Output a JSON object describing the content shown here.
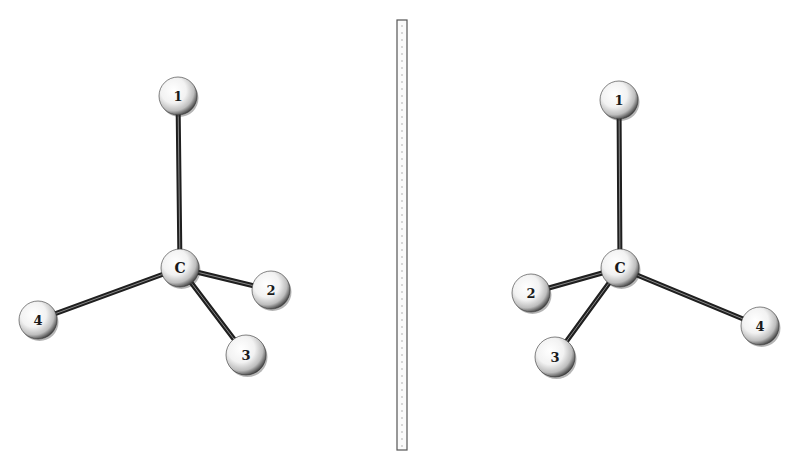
{
  "figure": {
    "colors": {
      "background": "#ffffff",
      "bond": "#1f1f1f",
      "atom_highlight": "#ffffff",
      "atom_shadow": "#2a2a2a",
      "mirror_edge": "#555555",
      "mirror_dots": "#9a9a9a"
    }
  },
  "left_molecule": {
    "center": {
      "label": "C",
      "x": 180,
      "y": 268,
      "r": 19
    },
    "substituents": [
      {
        "label": "1",
        "x": 178,
        "y": 96,
        "r": 19
      },
      {
        "label": "2",
        "x": 271,
        "y": 290,
        "r": 19
      },
      {
        "label": "3",
        "x": 246,
        "y": 355,
        "r": 20
      },
      {
        "label": "4",
        "x": 38,
        "y": 320,
        "r": 19
      }
    ]
  },
  "mirror": {
    "x": 397,
    "y": 20,
    "width": 10,
    "height": 430
  },
  "right_molecule": {
    "center": {
      "label": "C",
      "x": 620,
      "y": 268,
      "r": 19
    },
    "substituents": [
      {
        "label": "1",
        "x": 619,
        "y": 100,
        "r": 19
      },
      {
        "label": "2",
        "x": 531,
        "y": 293,
        "r": 19
      },
      {
        "label": "3",
        "x": 555,
        "y": 357,
        "r": 20
      },
      {
        "label": "4",
        "x": 760,
        "y": 326,
        "r": 19
      }
    ]
  }
}
